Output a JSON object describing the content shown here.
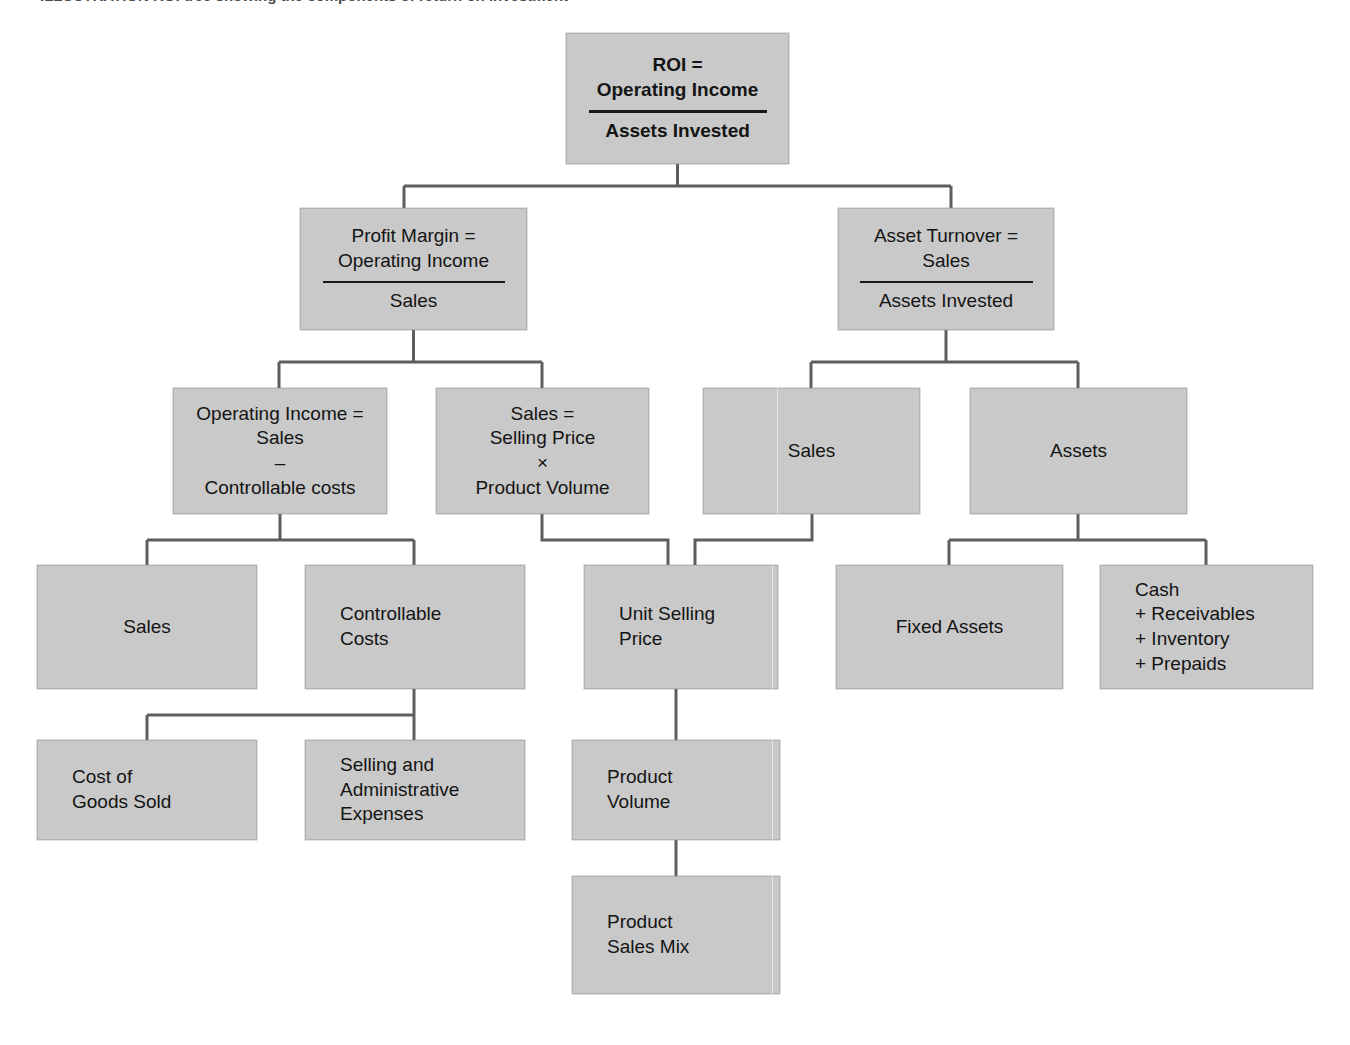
{
  "page": {
    "caption_ghost": "ILLUSTRATION  ROI tree showing the components of return on investment",
    "background": "#ffffff",
    "box_fill": "#c9c9c9",
    "box_border": "#b2b2b2",
    "connector_color": "#5e5e5e",
    "text_color": "#141414"
  },
  "diagram": {
    "type": "tree",
    "nodes": [
      {
        "id": "roi",
        "name": "roi",
        "bold": true,
        "align": "center",
        "numerator": [
          "ROI =",
          "Operating Income"
        ],
        "rule": true,
        "denominator": [
          "Assets Invested"
        ],
        "x": 566,
        "y": 33,
        "w": 223,
        "h": 131
      },
      {
        "id": "profit-margin",
        "name": "profit-margin",
        "bold": false,
        "align": "center",
        "numerator": [
          "Profit Margin =",
          "Operating Income"
        ],
        "rule": true,
        "denominator": [
          "Sales"
        ],
        "x": 300,
        "y": 208,
        "w": 227,
        "h": 122
      },
      {
        "id": "asset-turnover",
        "name": "asset-turnover",
        "bold": false,
        "align": "center",
        "numerator": [
          "Asset Turnover =",
          "Sales"
        ],
        "rule": true,
        "denominator": [
          "Assets Invested"
        ],
        "x": 838,
        "y": 208,
        "w": 216,
        "h": 122
      },
      {
        "id": "operating-income",
        "name": "operating-income",
        "bold": false,
        "align": "center",
        "numerator": [
          "Operating Income =",
          "Sales",
          "–",
          "Controllable costs"
        ],
        "rule": false,
        "denominator": [],
        "x": 173,
        "y": 388,
        "w": 214,
        "h": 126
      },
      {
        "id": "sales-formula",
        "name": "sales-formula",
        "bold": false,
        "align": "center",
        "numerator": [
          "Sales =",
          "Selling Price",
          "×",
          "Product Volume"
        ],
        "rule": false,
        "denominator": [],
        "x": 436,
        "y": 388,
        "w": 213,
        "h": 126
      },
      {
        "id": "sales-turnover",
        "name": "sales-turnover",
        "bold": false,
        "align": "center",
        "numerator": [
          "Sales"
        ],
        "rule": false,
        "denominator": [],
        "x": 703,
        "y": 388,
        "w": 217,
        "h": 126
      },
      {
        "id": "assets",
        "name": "assets",
        "bold": false,
        "align": "center",
        "numerator": [
          "Assets"
        ],
        "rule": false,
        "denominator": [],
        "x": 970,
        "y": 388,
        "w": 217,
        "h": 126
      },
      {
        "id": "sales-leaf",
        "name": "sales-leaf",
        "bold": false,
        "align": "center",
        "numerator": [
          "Sales"
        ],
        "rule": false,
        "denominator": [],
        "x": 37,
        "y": 565,
        "w": 220,
        "h": 124
      },
      {
        "id": "controllable-costs",
        "name": "controllable-costs",
        "bold": false,
        "align": "left",
        "numerator": [
          "Controllable",
          "Costs"
        ],
        "rule": false,
        "denominator": [],
        "x": 305,
        "y": 565,
        "w": 220,
        "h": 124
      },
      {
        "id": "unit-selling-price",
        "name": "unit-selling-price",
        "bold": false,
        "align": "left",
        "numerator": [
          "Unit Selling",
          "Price"
        ],
        "rule": false,
        "denominator": [],
        "x": 584,
        "y": 565,
        "w": 194,
        "h": 124
      },
      {
        "id": "fixed-assets",
        "name": "fixed-assets",
        "bold": false,
        "align": "center",
        "numerator": [
          "Fixed Assets"
        ],
        "rule": false,
        "denominator": [],
        "x": 836,
        "y": 565,
        "w": 227,
        "h": 124
      },
      {
        "id": "cash-group",
        "name": "cash-group",
        "bold": false,
        "align": "left",
        "numerator": [
          "Cash",
          "+ Receivables",
          "+ Inventory",
          "+ Prepaids"
        ],
        "rule": false,
        "denominator": [],
        "x": 1100,
        "y": 565,
        "w": 213,
        "h": 124
      },
      {
        "id": "cost-of-goods-sold",
        "name": "cost-of-goods-sold",
        "bold": false,
        "align": "left",
        "numerator": [
          "Cost of",
          "Goods Sold"
        ],
        "rule": false,
        "denominator": [],
        "x": 37,
        "y": 740,
        "w": 220,
        "h": 100
      },
      {
        "id": "selling-admin-expenses",
        "name": "selling-admin-expenses",
        "bold": false,
        "align": "left",
        "numerator": [
          "Selling and",
          "Administrative",
          "Expenses"
        ],
        "rule": false,
        "denominator": [],
        "x": 305,
        "y": 740,
        "w": 220,
        "h": 100
      },
      {
        "id": "product-volume",
        "name": "product-volume",
        "bold": false,
        "align": "left",
        "numerator": [
          "Product",
          "Volume"
        ],
        "rule": false,
        "denominator": [],
        "x": 572,
        "y": 740,
        "w": 208,
        "h": 100
      },
      {
        "id": "product-sales-mix",
        "name": "product-sales-mix",
        "bold": false,
        "align": "left",
        "numerator": [
          "Product",
          "Sales Mix"
        ],
        "rule": false,
        "denominator": [],
        "x": 572,
        "y": 876,
        "w": 208,
        "h": 118
      }
    ],
    "edges": [
      {
        "from": "roi",
        "to": "profit-margin"
      },
      {
        "from": "roi",
        "to": "asset-turnover"
      },
      {
        "from": "profit-margin",
        "to": "operating-income"
      },
      {
        "from": "profit-margin",
        "to": "sales-formula"
      },
      {
        "from": "asset-turnover",
        "to": "sales-turnover"
      },
      {
        "from": "asset-turnover",
        "to": "assets"
      },
      {
        "from": "operating-income",
        "to": "sales-leaf"
      },
      {
        "from": "operating-income",
        "to": "controllable-costs"
      },
      {
        "from": "sales-formula",
        "to": "unit-selling-price"
      },
      {
        "from": "sales-turnover",
        "to": "unit-selling-price"
      },
      {
        "from": "assets",
        "to": "fixed-assets"
      },
      {
        "from": "assets",
        "to": "cash-group"
      },
      {
        "from": "controllable-costs",
        "to": "cost-of-goods-sold"
      },
      {
        "from": "controllable-costs",
        "to": "selling-admin-expenses"
      },
      {
        "from": "unit-selling-price",
        "to": "product-volume"
      },
      {
        "from": "product-volume",
        "to": "product-sales-mix"
      }
    ]
  }
}
